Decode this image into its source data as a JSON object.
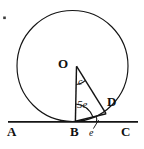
{
  "figure": {
    "background": "#ffffff",
    "ink": "#111111",
    "width": 144,
    "height": 149
  },
  "labels": {
    "center": "O",
    "tangent_left": "A",
    "tangent_point": "B",
    "tangent_right": "C",
    "circle_point": "D",
    "angle_at_o": "c",
    "angle_at_b_interior": "5e",
    "angle_at_b_exterior": "e"
  },
  "geometry": {
    "circle": {
      "cx": 72.5,
      "cy": 66,
      "r": 52.5
    },
    "points": {
      "O": {
        "x": 72.5,
        "y": 66
      },
      "B": {
        "x": 72.5,
        "y": 121.5
      },
      "D": {
        "x": 105,
        "y": 111
      },
      "A": {
        "x": 9,
        "y": 121.5
      },
      "C": {
        "x": 138,
        "y": 121.5
      }
    },
    "segments": [
      {
        "name": "tangent-line-AC",
        "from": "A",
        "to": "C"
      },
      {
        "name": "radius-OB",
        "from": "O",
        "to": "B"
      },
      {
        "name": "radius-OD",
        "from": "O",
        "to": "D"
      },
      {
        "name": "chord-BD",
        "from": "B",
        "to": "D"
      }
    ],
    "angle_marks": [
      {
        "name": "angle-arc-at-o",
        "label": "c"
      },
      {
        "name": "angle-arc-at-b-interior",
        "label": "5e"
      },
      {
        "name": "angle-arc-at-b-exterior",
        "label": "e"
      }
    ]
  },
  "marks": {
    "corner_dot": "•"
  }
}
